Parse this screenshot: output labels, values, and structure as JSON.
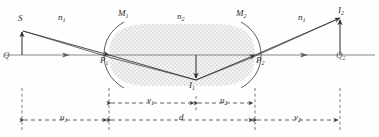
{
  "figure": {
    "type": "optics-ray-diagram",
    "background": "#fefefe",
    "ink_color": "#3a3a3a",
    "axis_color": "#6e6e6e",
    "medium_fill": "#f2f2f2",
    "medium_dot_color": "#b9b9b9"
  },
  "labels": {
    "source": "S",
    "object_foot": "Q",
    "surface_left": "M",
    "surface_left_sub": "1",
    "surface_right": "M",
    "surface_right_sub": "2",
    "vertex_left": "P",
    "vertex_left_sub": "1",
    "vertex_right": "P",
    "vertex_right_sub": "2",
    "index_left": "n",
    "index_left_sub": "1",
    "index_medium": "n",
    "index_medium_sub": "2",
    "index_right": "n",
    "index_right_sub": "1",
    "image_intermediate": "I",
    "image_intermediate_sub": "1",
    "image_final": "I",
    "image_final_sub": "2",
    "axis_point_right": "Q",
    "axis_point_right_sub": "2"
  },
  "dimensions": [
    {
      "id": "u1",
      "symbol": "u",
      "sub": "1",
      "from_x": 22,
      "to_x": 109,
      "row_y": 120,
      "tier": "lower"
    },
    {
      "id": "d",
      "symbol": "d",
      "sub": "",
      "from_x": 109,
      "to_x": 255,
      "row_y": 120,
      "tier": "lower"
    },
    {
      "id": "v2",
      "symbol": "v",
      "sub": "2",
      "from_x": 255,
      "to_x": 340,
      "row_y": 120,
      "tier": "lower"
    },
    {
      "id": "v1",
      "symbol": "v",
      "sub": "1",
      "from_x": 109,
      "to_x": 196,
      "row_y": 103,
      "tier": "upper"
    },
    {
      "id": "u2",
      "symbol": "u",
      "sub": "2",
      "from_x": 196,
      "to_x": 255,
      "row_y": 103,
      "tier": "upper"
    }
  ],
  "geometry": {
    "axis_y": 55,
    "axis_x_start": 4,
    "axis_x_end": 375,
    "object_x": 22,
    "object_top_y": 30,
    "vertex_left_x": 109,
    "vertex_right_x": 255,
    "lens_top_y": 24,
    "lens_bottom_y": 86,
    "image1_x": 196,
    "image1_bottom_y": 80,
    "image2_x": 340,
    "image2_top_y": 16,
    "dashed_lines_x": [
      22,
      109,
      196,
      255,
      340
    ]
  },
  "arrows": {
    "ray_direction_markers": 4,
    "object_arrow_direction": "up",
    "image1_arrow_direction": "down",
    "image2_arrow_direction": "up"
  }
}
